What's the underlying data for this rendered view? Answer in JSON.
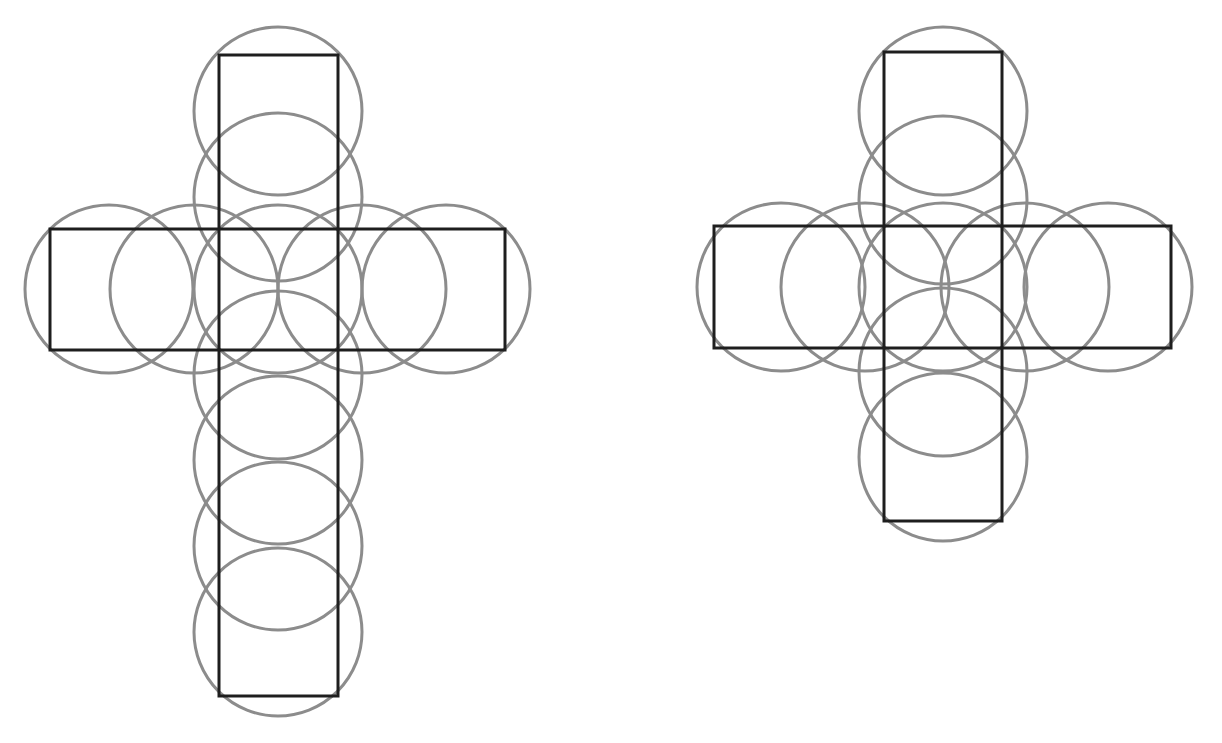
{
  "figures": [
    {
      "name": "left-cross-net",
      "rects": [
        {
          "x": 219,
          "y": 55,
          "w": 119,
          "h": 641
        },
        {
          "x": 50,
          "y": 229,
          "w": 455,
          "h": 121
        }
      ],
      "radius": 84,
      "circles": [
        [
          109,
          289
        ],
        [
          194,
          289
        ],
        [
          278,
          289
        ],
        [
          362,
          289
        ],
        [
          446,
          289
        ],
        [
          278,
          111
        ],
        [
          278,
          197
        ],
        [
          278,
          375
        ],
        [
          278,
          460
        ],
        [
          278,
          546
        ],
        [
          278,
          632
        ]
      ]
    },
    {
      "name": "right-cross-net",
      "rects": [
        {
          "x": 884,
          "y": 52,
          "w": 118,
          "h": 469
        },
        {
          "x": 714,
          "y": 226,
          "w": 457,
          "h": 122
        }
      ],
      "radius": 84,
      "circles": [
        [
          781,
          287
        ],
        [
          865,
          287
        ],
        [
          943,
          287
        ],
        [
          1025,
          287
        ],
        [
          1108,
          287
        ],
        [
          943,
          111
        ],
        [
          943,
          200
        ],
        [
          943,
          372
        ],
        [
          943,
          457
        ]
      ]
    }
  ],
  "colors": {
    "circle": "#8c8c8c",
    "rect": "#1e1e1e",
    "background": "#ffffff"
  }
}
